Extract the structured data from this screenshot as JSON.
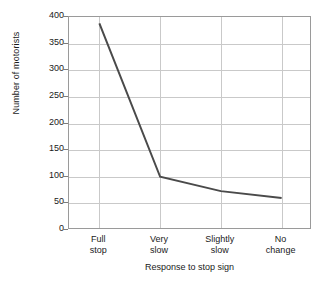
{
  "chart_data": {
    "type": "line",
    "title": "",
    "xlabel": "Response to stop sign",
    "ylabel": "Number of motorists",
    "categories": [
      "Full stop",
      "Very slow",
      "Slightly slow",
      "No change"
    ],
    "category_lines": [
      [
        "Full",
        "stop"
      ],
      [
        "Very",
        "slow"
      ],
      [
        "Slightly",
        "slow"
      ],
      [
        "No",
        "change"
      ]
    ],
    "values": [
      388,
      100,
      73,
      60
    ],
    "ylim": [
      0,
      400
    ],
    "yticks": [
      0,
      50,
      100,
      150,
      200,
      250,
      300,
      350,
      400
    ],
    "ytick_labels": [
      "0",
      "50",
      "100",
      "150",
      "200",
      "250",
      "300",
      "350",
      "400"
    ],
    "grid": true,
    "legend": "none",
    "series": [
      {
        "name": "Number of motorists",
        "values": [
          388,
          100,
          73,
          60
        ],
        "color": "#4a4a4a",
        "line_width": 2
      }
    ],
    "colors": {
      "line": "#4a4a4a",
      "grid": "#c9c9c9",
      "axis": "#9a9a9a",
      "text": "#1a1a1a",
      "background": "#ffffff"
    }
  }
}
